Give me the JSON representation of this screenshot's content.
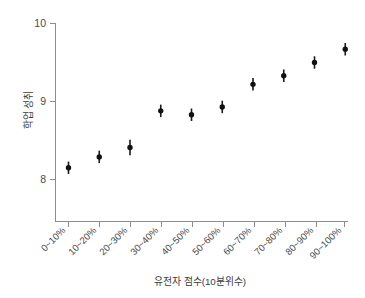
{
  "chart_data": {
    "type": "scatter",
    "title": "",
    "xlabel": "유전자 점수(10분위수)",
    "ylabel": "학업 성취",
    "categories": [
      "0~10%",
      "10~20%",
      "20~30%",
      "30~40%",
      "40~50%",
      "50~60%",
      "60~70%",
      "70~80%",
      "80~90%",
      "90~100%"
    ],
    "values": [
      8.15,
      8.29,
      8.41,
      8.88,
      8.83,
      8.93,
      9.22,
      9.33,
      9.5,
      9.67
    ],
    "errors_low": [
      8.07,
      8.21,
      8.31,
      8.8,
      8.75,
      8.85,
      9.14,
      9.25,
      9.42,
      9.59
    ],
    "errors_high": [
      8.23,
      8.37,
      8.51,
      8.96,
      8.91,
      9.01,
      9.3,
      9.41,
      9.58,
      9.75
    ],
    "ylim": [
      7.55,
      10.1
    ],
    "yticks": [
      8,
      9,
      10
    ],
    "ytick_labels": [
      "8",
      "9",
      "10"
    ],
    "grid": false,
    "legend": "none",
    "marker": "filled-circle-with-error-bar",
    "marker_color": "#111111",
    "axis_color": "#8d8d8d",
    "background_color": "#ffffff"
  },
  "axes": {
    "y_axis_name": "y-axis",
    "x_axis_name": "x-axis"
  }
}
